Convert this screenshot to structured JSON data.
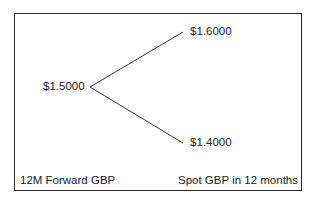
{
  "diagram": {
    "type": "binomial-tree",
    "origin": {
      "label": "$1.5000"
    },
    "outcomes": [
      {
        "label": "$1.6000",
        "direction": "up"
      },
      {
        "label": "$1.4000",
        "direction": "down"
      }
    ],
    "captions": {
      "left": "12M Forward GBP",
      "right": "Spot GBP in 12 months"
    },
    "colors": {
      "line": "#333333",
      "border": "#2a2a2a",
      "text": "#1a1a1a"
    }
  }
}
